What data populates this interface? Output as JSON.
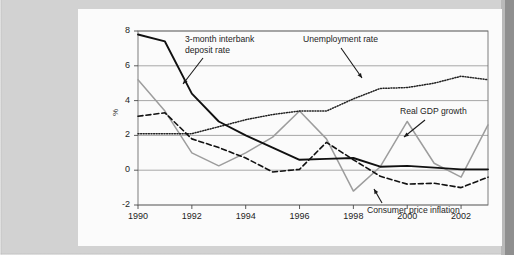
{
  "figure": {
    "background_color": "#d2d2d2",
    "card_color": "#fbfbfb",
    "edge_strip_color": "#8f8f8f"
  },
  "chart_data": {
    "type": "line",
    "title": "",
    "subtitle": "",
    "xlabel": "",
    "ylabel": "%",
    "xlim": [
      1990,
      2003
    ],
    "ylim": [
      -2,
      8
    ],
    "yticks": [
      -2,
      0,
      2,
      4,
      6,
      8
    ],
    "xticks": [
      1990,
      1992,
      1994,
      1996,
      1998,
      2000,
      2002
    ],
    "ytick_labels": [
      "-2",
      "0",
      "2",
      "4",
      "6",
      "8"
    ],
    "xtick_labels": [
      "1990",
      "1992",
      "1994",
      "1996",
      "1998",
      "2000",
      "2002"
    ],
    "grid": "horizontal",
    "grid_color": "#9a9a9a",
    "legend_position": "annotations-inline",
    "x": [
      1990,
      1991,
      1992,
      1993,
      1994,
      1995,
      1996,
      1997,
      1998,
      1999,
      2000,
      2001,
      2002,
      2003
    ],
    "series": [
      {
        "name": "3-month interbank deposit rate",
        "style": "solid",
        "color": "#111111",
        "values": [
          7.8,
          7.4,
          4.4,
          2.8,
          2.0,
          1.3,
          0.6,
          0.65,
          0.7,
          0.2,
          0.25,
          0.15,
          0.05,
          0.05
        ]
      },
      {
        "name": "Unemployment rate",
        "style": "dotted",
        "color": "#222222",
        "values": [
          2.1,
          2.1,
          2.1,
          2.5,
          2.9,
          3.2,
          3.4,
          3.4,
          4.1,
          4.7,
          4.75,
          5.0,
          5.4,
          5.2
        ]
      },
      {
        "name": "Real GDP growth",
        "style": "solid",
        "color": "#9d9d9d",
        "values": [
          5.2,
          3.4,
          1.0,
          0.25,
          1.0,
          1.9,
          3.4,
          1.8,
          -1.2,
          0.2,
          2.8,
          0.4,
          -0.4,
          2.6
        ]
      },
      {
        "name": "Consumer price inflation",
        "style": "dashed",
        "color": "#111111",
        "values": [
          3.1,
          3.3,
          1.8,
          1.3,
          0.7,
          -0.1,
          0.05,
          1.6,
          0.6,
          -0.35,
          -0.8,
          -0.75,
          -1.0,
          -0.4
        ]
      }
    ],
    "annotations": [
      {
        "text_line1": "3-month interbank",
        "text_line2": "deposit rate",
        "target_series": "3-month interbank deposit rate"
      },
      {
        "text_line1": "Unemployment rate",
        "text_line2": "",
        "target_series": "Unemployment rate"
      },
      {
        "text_line1": "Real GDP growth",
        "text_line2": "",
        "target_series": "Real GDP growth"
      },
      {
        "text_line1": "Consumer price inflation",
        "text_line2": "",
        "target_series": "Consumer price inflation"
      }
    ]
  }
}
